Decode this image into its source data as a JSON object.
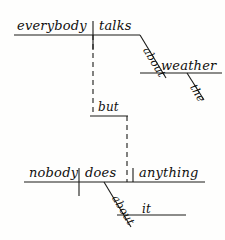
{
  "diagram": {
    "type": "reed-kellogg-sentence-diagram",
    "sentence": "Everybody talks about the weather but nobody does anything about it.",
    "stroke_color": "#1a1a18",
    "background_color": "#fefefd",
    "clauses": [
      {
        "id": "main-clause-1",
        "subject": "everybody",
        "verb": "talks",
        "modifiers": [
          {
            "id": "prep-about-1",
            "word": "about",
            "orientation": "diagonal"
          },
          {
            "id": "object-weather",
            "word": "weather",
            "orientation": "horizontal"
          },
          {
            "id": "article-the",
            "word": "the",
            "orientation": "diagonal"
          }
        ]
      },
      {
        "id": "conjunction",
        "word": "but",
        "orientation": "horizontal-dashed-bridge"
      },
      {
        "id": "main-clause-2",
        "subject": "nobody",
        "verb": "does",
        "direct_object": "anything",
        "modifiers": [
          {
            "id": "prep-about-2",
            "word": "about",
            "orientation": "diagonal"
          },
          {
            "id": "object-it",
            "word": "it",
            "orientation": "horizontal"
          }
        ]
      }
    ],
    "words": {
      "everybody": "everybody",
      "talks": "talks",
      "about_1": "about",
      "weather": "weather",
      "the": "the",
      "but": "but",
      "nobody": "nobody",
      "does": "does",
      "anything": "anything",
      "about_2": "about",
      "it": "it"
    }
  }
}
